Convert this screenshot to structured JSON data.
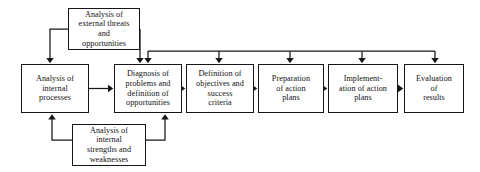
{
  "diagram": {
    "background_color": "#ffffff",
    "line_color": "#16161a",
    "box_border_color": "#16161a",
    "box_fill_color": "#ffffff",
    "text_color": "#111114",
    "nodes": [
      {
        "id": "external",
        "label": "Analysis of\nexternal threats\nand\nopportunities",
        "x": 68,
        "y": 8,
        "w": 72,
        "h": 42,
        "font_size": 8.2
      },
      {
        "id": "internal-processes",
        "label": "Analysis of\ninternal\nprocesses",
        "x": 21,
        "y": 64,
        "w": 68,
        "h": 49,
        "font_size": 8.2
      },
      {
        "id": "internal-strengths",
        "label": "Analysis of\ninternal\nstrengths and\nweaknesses",
        "x": 72,
        "y": 124,
        "w": 74,
        "h": 42,
        "font_size": 8.2
      },
      {
        "id": "diagnosis",
        "label": "Diagnosis of\nproblems and\ndefinition of\nopportunities",
        "x": 114,
        "y": 64,
        "w": 68,
        "h": 49,
        "font_size": 8.2
      },
      {
        "id": "objectives",
        "label": "Definition of\nobjectives and\nsuccess\ncriteria",
        "x": 186,
        "y": 64,
        "w": 68,
        "h": 49,
        "font_size": 8.2
      },
      {
        "id": "preparation",
        "label": "Preparation\nof action\nplans",
        "x": 258,
        "y": 64,
        "w": 66,
        "h": 49,
        "font_size": 8.2
      },
      {
        "id": "implementation",
        "label": "Implement-\nation of action\nplans",
        "x": 328,
        "y": 64,
        "w": 70,
        "h": 49,
        "font_size": 8.2
      },
      {
        "id": "evaluation",
        "label": "Evaluation\nof\nresults",
        "x": 404,
        "y": 64,
        "w": 60,
        "h": 49,
        "font_size": 8.2
      }
    ],
    "connections": [
      {
        "from": "external",
        "to": "internal-processes",
        "kind": "elbow-down-left"
      },
      {
        "from": "external",
        "to": "diagnosis",
        "kind": "elbow-down-right"
      },
      {
        "from": "internal-processes",
        "to": "diagnosis",
        "kind": "horizontal"
      },
      {
        "from": "internal-strengths",
        "to": "internal-processes",
        "kind": "elbow-up-left"
      },
      {
        "from": "internal-strengths",
        "to": "diagnosis",
        "kind": "elbow-up-right"
      },
      {
        "from": "diagnosis",
        "to": "objectives",
        "kind": "horizontal"
      },
      {
        "from": "objectives",
        "to": "preparation",
        "kind": "horizontal"
      },
      {
        "from": "preparation",
        "to": "implementation",
        "kind": "horizontal"
      },
      {
        "from": "implementation",
        "to": "evaluation",
        "kind": "horizontal"
      },
      {
        "from": "evaluation",
        "to": "diagnosis",
        "kind": "feedback-bus"
      },
      {
        "from": "evaluation",
        "to": "objectives",
        "kind": "feedback-bus"
      },
      {
        "from": "evaluation",
        "to": "preparation",
        "kind": "feedback-bus"
      },
      {
        "from": "evaluation",
        "to": "implementation",
        "kind": "feedback-bus"
      },
      {
        "from": "evaluation",
        "to": "evaluation",
        "kind": "feedback-bus"
      }
    ]
  }
}
